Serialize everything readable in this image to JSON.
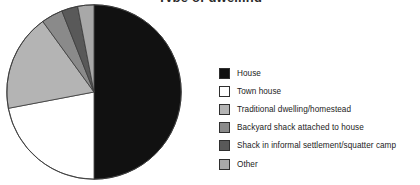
{
  "chart_data": {
    "type": "pie",
    "title": "Type of dwelling",
    "xlabel": "",
    "ylabel": "",
    "legend_position": "right",
    "grid": false,
    "categories": [
      "House",
      "Town house",
      "Traditional dwelling/homestead",
      "Backyard shack attached to house",
      "Shack in informal settlement/squatter camp",
      "Other"
    ],
    "values": [
      50,
      22,
      18,
      4,
      3,
      3
    ],
    "units": "percent",
    "colors": [
      "#111111",
      "#ffffff",
      "#b4b4b4",
      "#8a8a8a",
      "#595959",
      "#a8a8a8"
    ],
    "start_angle_deg": 0,
    "direction": "clockwise",
    "slices": [
      {
        "label": "House",
        "value": 50,
        "color": "#111111",
        "start_deg": 0,
        "end_deg": 180
      },
      {
        "label": "Town house",
        "value": 22,
        "color": "#ffffff",
        "start_deg": 180,
        "end_deg": 259.2
      },
      {
        "label": "Traditional dwelling/homestead",
        "value": 18,
        "color": "#b4b4b4",
        "start_deg": 259.2,
        "end_deg": 324
      },
      {
        "label": "Backyard shack attached to house",
        "value": 4,
        "color": "#8a8a8a",
        "start_deg": 324,
        "end_deg": 338.4
      },
      {
        "label": "Shack in informal settlement/squatter camp",
        "value": 3,
        "color": "#595959",
        "start_deg": 338.4,
        "end_deg": 349.2
      },
      {
        "label": "Other",
        "value": 3,
        "color": "#a8a8a8",
        "start_deg": 349.2,
        "end_deg": 360
      }
    ]
  },
  "legend": {
    "items": [
      {
        "label": "House",
        "color": "#111111"
      },
      {
        "label": "Town house",
        "color": "#ffffff"
      },
      {
        "label": "Traditional dwelling/homestead",
        "color": "#b4b4b4"
      },
      {
        "label": "Backyard shack attached to house",
        "color": "#8a8a8a"
      },
      {
        "label": "Shack in informal settlement/squatter camp",
        "color": "#595959"
      },
      {
        "label": "Other",
        "color": "#a8a8a8"
      }
    ]
  }
}
